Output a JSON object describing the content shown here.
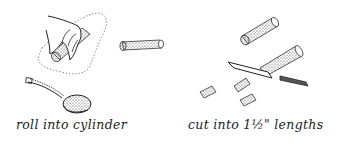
{
  "illustration": {
    "panels": [
      {
        "caption": "roll into cylinder",
        "elements": [
          "hand-rolling-dough",
          "dough-cylinder",
          "spoon-with-filling",
          "dotted-work-surface"
        ]
      },
      {
        "caption": "cut into 1½\" lengths",
        "elements": [
          "dough-roll-whole",
          "dough-roll-being-cut",
          "knife",
          "cut-pieces"
        ]
      }
    ],
    "ink_color": "#222222",
    "background": "#ffffff"
  }
}
